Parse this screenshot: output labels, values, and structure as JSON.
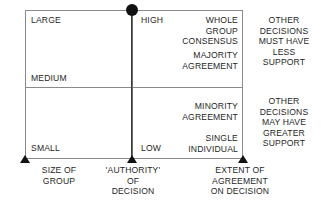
{
  "diagram": {
    "colors": {
      "frame": "#8a8a8a",
      "axis": "#3a3a3a",
      "marker": "#111111",
      "text": "#1f1f1f",
      "background": "#ffffff"
    },
    "group_size_scale": {
      "large": "LARGE",
      "medium": "MEDIUM",
      "small": "SMALL"
    },
    "authority_scale": {
      "high": "HIGH",
      "low": "LOW"
    },
    "agreement_levels": {
      "whole_group_consensus": "WHOLE\nGROUP\nCONSENSUS",
      "majority_agreement": "MAJORITY\nAGREEMENT",
      "minority_agreement": "MINORITY\nAGREEMENT",
      "single_individual": "SINGLE\nINDIVIDUAL"
    },
    "notes": {
      "upper": "OTHER\nDECISIONS\nMUST HAVE\nLESS\nSUPPORT",
      "lower": "OTHER\nDECISIONS\nMAY HAVE\nGREATER\nSUPPORT"
    },
    "axis_captions": {
      "size_of_group": "SIZE OF\nGROUP",
      "authority_of_decision": "'AUTHORITY'\nOF\nDECISION",
      "extent_of_agreement": "EXTENT OF\nAGREEMENT\nON DECISION"
    }
  }
}
